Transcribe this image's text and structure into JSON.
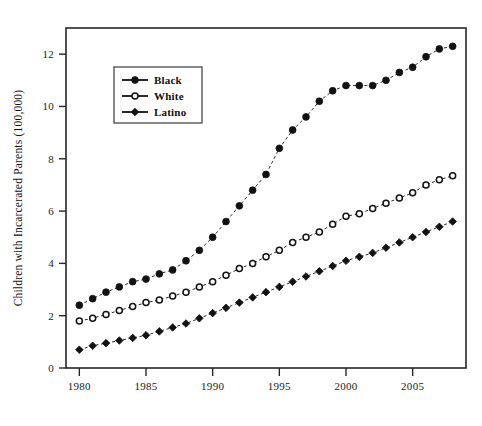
{
  "chart_data": {
    "type": "line",
    "title": "",
    "xlabel": "",
    "ylabel": "Children with Incarcerated Parents (100,000)",
    "xlim": [
      1979,
      2009
    ],
    "ylim": [
      0,
      13
    ],
    "xticks": [
      1980,
      1985,
      1990,
      1995,
      2000,
      2005
    ],
    "yticks": [
      0,
      2,
      4,
      6,
      8,
      10,
      12
    ],
    "grid": false,
    "legend_position": "upper left",
    "x": [
      1980,
      1981,
      1982,
      1983,
      1984,
      1985,
      1986,
      1987,
      1988,
      1989,
      1990,
      1991,
      1992,
      1993,
      1994,
      1995,
      1996,
      1997,
      1998,
      1999,
      2000,
      2001,
      2002,
      2003,
      2004,
      2005,
      2006,
      2007,
      2008
    ],
    "series": [
      {
        "name": "Black",
        "marker": "filled-circle",
        "values": [
          2.4,
          2.65,
          2.9,
          3.1,
          3.3,
          3.4,
          3.6,
          3.75,
          4.1,
          4.5,
          5.0,
          5.6,
          6.2,
          6.8,
          7.4,
          8.4,
          9.1,
          9.6,
          10.2,
          10.6,
          10.8,
          10.8,
          10.8,
          11.0,
          11.3,
          11.5,
          11.9,
          12.2,
          12.3
        ]
      },
      {
        "name": "White",
        "marker": "open-circle",
        "values": [
          1.8,
          1.9,
          2.05,
          2.2,
          2.35,
          2.5,
          2.6,
          2.75,
          2.9,
          3.1,
          3.3,
          3.55,
          3.8,
          4.0,
          4.25,
          4.5,
          4.8,
          5.0,
          5.2,
          5.5,
          5.8,
          5.9,
          6.1,
          6.3,
          6.5,
          6.7,
          7.0,
          7.2,
          7.35
        ]
      },
      {
        "name": "Latino",
        "marker": "diamond",
        "values": [
          0.7,
          0.85,
          0.95,
          1.05,
          1.15,
          1.25,
          1.4,
          1.55,
          1.7,
          1.9,
          2.1,
          2.3,
          2.5,
          2.7,
          2.9,
          3.1,
          3.3,
          3.5,
          3.7,
          3.9,
          4.1,
          4.25,
          4.4,
          4.6,
          4.8,
          5.0,
          5.2,
          5.4,
          5.6
        ]
      }
    ]
  }
}
